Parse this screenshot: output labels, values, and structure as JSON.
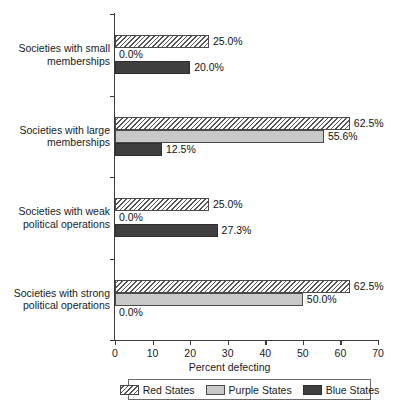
{
  "chart_data": {
    "type": "bar",
    "orientation": "horizontal",
    "title": "",
    "xlabel": "Percent defecting",
    "ylabel": "",
    "xlim": [
      0,
      70
    ],
    "xticks": [
      0,
      10,
      20,
      30,
      40,
      50,
      60,
      70
    ],
    "grid": false,
    "legend_position": "bottom",
    "categories": [
      "Societies with small memberships",
      "Societies with large memberships",
      "Societies with weak political operations",
      "Societies with strong political operations"
    ],
    "category_lines": [
      [
        "Societies with small",
        "memberships"
      ],
      [
        "Societies with large",
        "memberships"
      ],
      [
        "Societies with weak",
        "political operations"
      ],
      [
        "Societies with strong",
        "political operations"
      ]
    ],
    "series": [
      {
        "name": "Red States",
        "color": "#ffffff",
        "pattern": "diagonal-hatch",
        "values": [
          25.0,
          62.5,
          25.0,
          62.5
        ],
        "labels": [
          "25.0%",
          "62.5%",
          "25.0%",
          "62.5%"
        ]
      },
      {
        "name": "Purple States",
        "color": "#c8c8c8",
        "pattern": "solid",
        "values": [
          0.0,
          55.6,
          0.0,
          50.0
        ],
        "labels": [
          "0.0%",
          "55.6%",
          "0.0%",
          "50.0%"
        ]
      },
      {
        "name": "Blue States",
        "color": "#3f3f3f",
        "pattern": "solid",
        "values": [
          20.0,
          12.5,
          27.3,
          0.0
        ],
        "labels": [
          "20.0%",
          "12.5%",
          "27.3%",
          "0.0%"
        ]
      }
    ]
  }
}
